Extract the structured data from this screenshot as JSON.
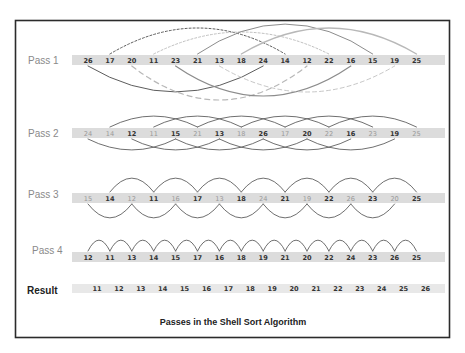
{
  "caption": "Passes in the Shell Sort Algorithm",
  "layout": {
    "first_col_x": 88,
    "col_step": 21.9,
    "bar_x": 72,
    "bar_w": 373,
    "bar_h": 10
  },
  "passes": [
    {
      "label": "Pass 1",
      "gap": 8,
      "values": [
        "26",
        "17",
        "20",
        "11",
        "23",
        "21",
        "13",
        "18",
        "24",
        "14",
        "12",
        "22",
        "16",
        "15",
        "19",
        "25"
      ],
      "dim": []
    },
    {
      "label": "Pass 2",
      "gap": 4,
      "values": [
        "24",
        "14",
        "12",
        "11",
        "15",
        "21",
        "13",
        "18",
        "26",
        "17",
        "20",
        "22",
        "16",
        "23",
        "19",
        "25"
      ],
      "dim": [
        0,
        1,
        3,
        5,
        7,
        9,
        11,
        13,
        15
      ]
    },
    {
      "label": "Pass 3",
      "gap": 2,
      "values": [
        "15",
        "14",
        "12",
        "11",
        "16",
        "17",
        "13",
        "18",
        "24",
        "21",
        "19",
        "22",
        "26",
        "23",
        "20",
        "25"
      ],
      "dim": [
        0,
        2,
        4,
        6,
        8,
        10,
        12,
        14
      ]
    },
    {
      "label": "Pass 4",
      "gap": 1,
      "values": [
        "12",
        "11",
        "13",
        "14",
        "15",
        "17",
        "16",
        "18",
        "19",
        "21",
        "20",
        "22",
        "24",
        "23",
        "26",
        "25"
      ],
      "dim": []
    }
  ],
  "result": {
    "label": "Result",
    "values": [
      "11",
      "12",
      "13",
      "14",
      "15",
      "16",
      "17",
      "18",
      "19",
      "20",
      "21",
      "22",
      "23",
      "24",
      "25",
      "26"
    ]
  },
  "colors": {
    "frame": "#2b2b2b",
    "bar": "#dcdcdc",
    "arc_dark": "#4a4a4a",
    "arc_mid": "#8c8c8c",
    "arc_light": "#b8b8b8",
    "label_gray": "#8a8a8a"
  }
}
